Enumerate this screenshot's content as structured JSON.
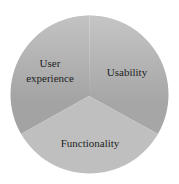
{
  "chart_data": {
    "type": "pie",
    "title": "",
    "categories": [
      "User experience",
      "Usability",
      "Functionality"
    ],
    "values": [
      33.33,
      33.33,
      33.33
    ],
    "slices": [
      {
        "name": "User experience",
        "label_lines": [
          "User",
          "experience"
        ],
        "value": 33.33,
        "color": "#a3a3a3",
        "start_angle_deg": 240,
        "end_angle_deg": 360
      },
      {
        "name": "Usability",
        "label_lines": [
          "Usability"
        ],
        "value": 33.33,
        "color": "#a6a6a6",
        "start_angle_deg": 0,
        "end_angle_deg": 120
      },
      {
        "name": "Functionality",
        "label_lines": [
          "Functionality"
        ],
        "value": 33.33,
        "color": "#bfbfbf",
        "start_angle_deg": 120,
        "end_angle_deg": 240
      }
    ],
    "legend": "none",
    "labels_inside": true
  },
  "labels": {
    "user_experience_line1": "User",
    "user_experience_line2": "experience",
    "usability": "Usability",
    "functionality": "Functionality"
  },
  "colors": {
    "background": "#ffffff",
    "highlight_top": "#d2d2d2",
    "text": "#1e1e1e"
  }
}
